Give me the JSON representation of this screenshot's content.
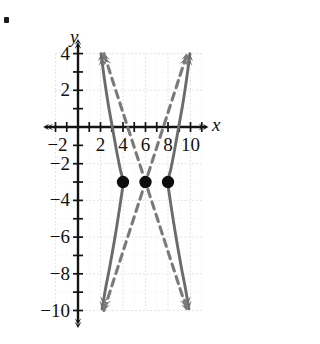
{
  "figure": {
    "kind": "coordinate-plane-graph",
    "bullet_marker": "•",
    "axis_labels": {
      "x": "x",
      "y": "y"
    },
    "colors": {
      "curve": "#6b6b6b",
      "asymptote": "#7a7a7a",
      "axis": "#141414",
      "grid": "#d9d9d9",
      "point": "#0d0d0d",
      "background": "#ffffff"
    }
  },
  "chart_data": {
    "type": "line",
    "title": "",
    "xlabel": "x",
    "ylabel": "y",
    "xlim": [
      -3,
      11.6
    ],
    "ylim": [
      -10.8,
      4.8
    ],
    "grid": true,
    "grid_step": 1,
    "grid_major_step": 2,
    "legend": "none",
    "x_ticks": [
      -2,
      -1,
      0,
      1,
      2,
      3,
      4,
      5,
      6,
      7,
      8,
      9,
      10,
      11
    ],
    "x_tick_labels": [
      {
        "value": -2,
        "text": "−2"
      },
      {
        "value": 2,
        "text": "2"
      },
      {
        "value": 4,
        "text": "4"
      },
      {
        "value": 6,
        "text": "6"
      },
      {
        "value": 8,
        "text": "8"
      },
      {
        "value": 10,
        "text": "10"
      }
    ],
    "y_ticks": [
      4,
      3,
      2,
      1,
      0,
      -1,
      -2,
      -3,
      -4,
      -5,
      -6,
      -7,
      -8,
      -9,
      -10
    ],
    "y_tick_labels": [
      {
        "value": 4,
        "text": "4"
      },
      {
        "value": 2,
        "text": "2"
      },
      {
        "value": -2,
        "text": "−2"
      },
      {
        "value": -4,
        "text": "−4"
      },
      {
        "value": -6,
        "text": "−6"
      },
      {
        "value": -8,
        "text": "−8"
      },
      {
        "value": -10,
        "text": "−10"
      }
    ],
    "series": [
      {
        "name": "hyperbola-left-branch",
        "style": "solid",
        "arrows": "both",
        "points": [
          [
            2.05,
            4.0
          ],
          [
            2.35,
            2.6
          ],
          [
            2.7,
            1.2
          ],
          [
            3.05,
            0.0
          ],
          [
            3.4,
            -1.2
          ],
          [
            3.75,
            -2.3
          ],
          [
            4.0,
            -3.0
          ],
          [
            3.8,
            -4.0
          ],
          [
            3.5,
            -5.2
          ],
          [
            3.15,
            -6.5
          ],
          [
            2.8,
            -7.7
          ],
          [
            2.45,
            -8.8
          ],
          [
            2.15,
            -9.9
          ]
        ]
      },
      {
        "name": "hyperbola-right-branch",
        "style": "solid",
        "arrows": "both",
        "points": [
          [
            9.95,
            4.0
          ],
          [
            9.65,
            2.6
          ],
          [
            9.3,
            1.2
          ],
          [
            8.95,
            0.0
          ],
          [
            8.6,
            -1.2
          ],
          [
            8.25,
            -2.3
          ],
          [
            8.0,
            -3.0
          ],
          [
            8.2,
            -4.0
          ],
          [
            8.5,
            -5.2
          ],
          [
            8.85,
            -6.5
          ],
          [
            9.2,
            -7.7
          ],
          [
            9.55,
            -8.8
          ],
          [
            9.85,
            -9.9
          ]
        ]
      },
      {
        "name": "asymptote-negative-slope",
        "style": "dashed",
        "arrows": "both",
        "points": [
          [
            2.3,
            4.0
          ],
          [
            6.0,
            -3.0
          ],
          [
            9.7,
            -10.0
          ]
        ]
      },
      {
        "name": "asymptote-positive-slope",
        "style": "dashed",
        "arrows": "both",
        "points": [
          [
            2.3,
            -10.0
          ],
          [
            6.0,
            -3.0
          ],
          [
            9.7,
            4.0
          ]
        ]
      }
    ],
    "points": [
      {
        "label": "vertex-left",
        "x": 4,
        "y": -3
      },
      {
        "label": "center",
        "x": 6,
        "y": -3
      },
      {
        "label": "vertex-right",
        "x": 8,
        "y": -3
      }
    ],
    "annotations": []
  }
}
